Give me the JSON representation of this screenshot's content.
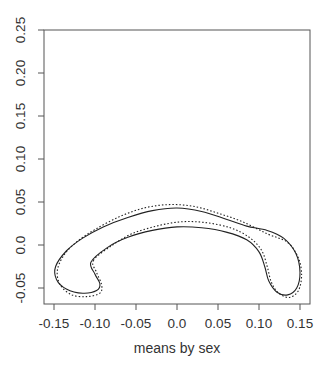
{
  "chart_data": {
    "type": "line",
    "title": "",
    "xlabel": "means by sex",
    "ylabel": "",
    "xlim": [
      -0.165,
      0.165
    ],
    "ylim": [
      -0.07,
      0.255
    ],
    "x_ticks": [
      "-0.15",
      "-0.10",
      "-0.05",
      "0.0",
      "0.05",
      "0.10",
      "0.15"
    ],
    "y_ticks": [
      "-0.05",
      "0.0",
      "0.05",
      "0.10",
      "0.15",
      "0.20",
      "0.25"
    ],
    "grid": false,
    "legend": null,
    "series": [
      {
        "name": "solid contour",
        "style": "solid",
        "closed": true,
        "points": [
          [
            -0.105,
            -0.02
          ],
          [
            -0.085,
            -0.003
          ],
          [
            -0.06,
            0.009
          ],
          [
            -0.03,
            0.017
          ],
          [
            0.0,
            0.021
          ],
          [
            0.03,
            0.02
          ],
          [
            0.06,
            0.015
          ],
          [
            0.085,
            0.006
          ],
          [
            0.1,
            -0.008
          ],
          [
            0.107,
            -0.025
          ],
          [
            0.112,
            -0.042
          ],
          [
            0.122,
            -0.055
          ],
          [
            0.135,
            -0.058
          ],
          [
            0.146,
            -0.05
          ],
          [
            0.15,
            -0.032
          ],
          [
            0.145,
            -0.01
          ],
          [
            0.13,
            0.008
          ],
          [
            0.11,
            0.017
          ],
          [
            0.085,
            0.022
          ],
          [
            0.06,
            0.03
          ],
          [
            0.03,
            0.039
          ],
          [
            0.0,
            0.043
          ],
          [
            -0.03,
            0.04
          ],
          [
            -0.06,
            0.032
          ],
          [
            -0.09,
            0.021
          ],
          [
            -0.115,
            0.008
          ],
          [
            -0.135,
            -0.007
          ],
          [
            -0.148,
            -0.025
          ],
          [
            -0.147,
            -0.04
          ],
          [
            -0.135,
            -0.051
          ],
          [
            -0.115,
            -0.056
          ],
          [
            -0.098,
            -0.053
          ],
          [
            -0.094,
            -0.045
          ],
          [
            -0.1,
            -0.034
          ]
        ]
      },
      {
        "name": "dotted contour",
        "style": "dotted",
        "closed": true,
        "points": [
          [
            -0.102,
            -0.018
          ],
          [
            -0.08,
            -0.001
          ],
          [
            -0.055,
            0.013
          ],
          [
            -0.025,
            0.022
          ],
          [
            0.005,
            0.027
          ],
          [
            0.035,
            0.026
          ],
          [
            0.065,
            0.02
          ],
          [
            0.088,
            0.009
          ],
          [
            0.103,
            -0.006
          ],
          [
            0.11,
            -0.025
          ],
          [
            0.115,
            -0.043
          ],
          [
            0.124,
            -0.056
          ],
          [
            0.137,
            -0.061
          ],
          [
            0.148,
            -0.053
          ],
          [
            0.152,
            -0.035
          ],
          [
            0.148,
            -0.015
          ],
          [
            0.135,
            0.003
          ],
          [
            0.11,
            0.013
          ],
          [
            0.08,
            0.027
          ],
          [
            0.05,
            0.037
          ],
          [
            0.02,
            0.045
          ],
          [
            -0.01,
            0.047
          ],
          [
            -0.04,
            0.043
          ],
          [
            -0.07,
            0.033
          ],
          [
            -0.1,
            0.018
          ],
          [
            -0.122,
            0.004
          ],
          [
            -0.138,
            -0.012
          ],
          [
            -0.146,
            -0.03
          ],
          [
            -0.142,
            -0.047
          ],
          [
            -0.128,
            -0.058
          ],
          [
            -0.11,
            -0.06
          ],
          [
            -0.094,
            -0.056
          ],
          [
            -0.092,
            -0.046
          ],
          [
            -0.098,
            -0.032
          ]
        ]
      }
    ]
  },
  "caption": "[caption text cut off at image bottom]"
}
